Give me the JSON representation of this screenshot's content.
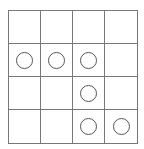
{
  "board": {
    "rows": 4,
    "cols": 4,
    "cells": [
      [
        0,
        0,
        0,
        0
      ],
      [
        1,
        1,
        1,
        0
      ],
      [
        0,
        0,
        1,
        0
      ],
      [
        0,
        0,
        1,
        1
      ]
    ],
    "piece": "circle-outline"
  }
}
